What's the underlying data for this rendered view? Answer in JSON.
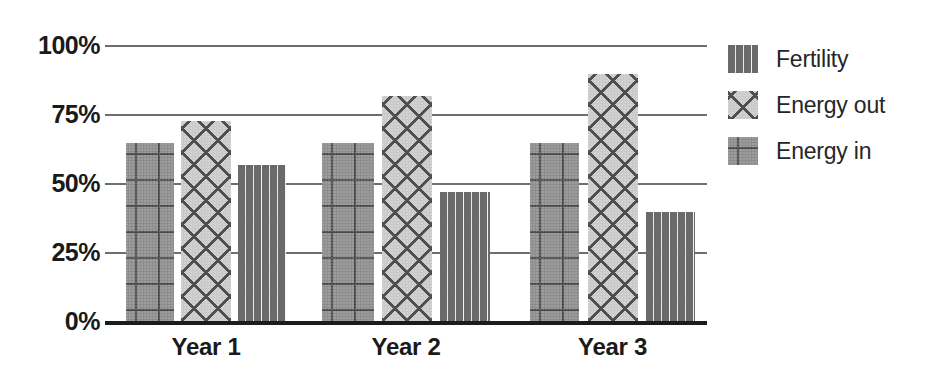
{
  "chart_data": {
    "type": "bar",
    "title": "",
    "xlabel": "",
    "ylabel": "",
    "categories": [
      "Year 1",
      "Year 2",
      "Year 3"
    ],
    "series": [
      {
        "name": "Energy in",
        "pattern": "plus-marks-gray",
        "values": [
          65,
          65,
          65
        ]
      },
      {
        "name": "Energy out",
        "pattern": "diagonal-crosshatch",
        "values": [
          73,
          82,
          90
        ]
      },
      {
        "name": "Fertility",
        "pattern": "dashes-light",
        "values": [
          57,
          47,
          40
        ]
      }
    ],
    "y_ticks": [
      "0%",
      "25%",
      "50%",
      "75%",
      "100%"
    ],
    "y_tick_values": [
      0,
      25,
      50,
      75,
      100
    ],
    "ylim": [
      0,
      100
    ],
    "grid": true,
    "grid_axis": "y",
    "legend_position": "right",
    "legend_order": [
      "Fertility",
      "Energy out",
      "Energy in"
    ],
    "units": "percent"
  },
  "axis": {
    "y_labels": [
      "100%",
      "75%",
      "50%",
      "25%",
      "0%"
    ],
    "x_labels": [
      "Year 1",
      "Year 2",
      "Year 3"
    ]
  },
  "legend": {
    "items": [
      {
        "label": "Fertility"
      },
      {
        "label": "Energy out"
      },
      {
        "label": "Energy in"
      }
    ]
  },
  "colors": {
    "energy_in_fill": "#8d8d8d",
    "energy_out_fill": "#c9c9c9",
    "fertility_fill": "#f2f2f2",
    "pattern_ink": "#4f4f4f",
    "gridline": "#6e6e6e",
    "axis_line": "#1c1c1c",
    "text": "#1a1a1a"
  }
}
